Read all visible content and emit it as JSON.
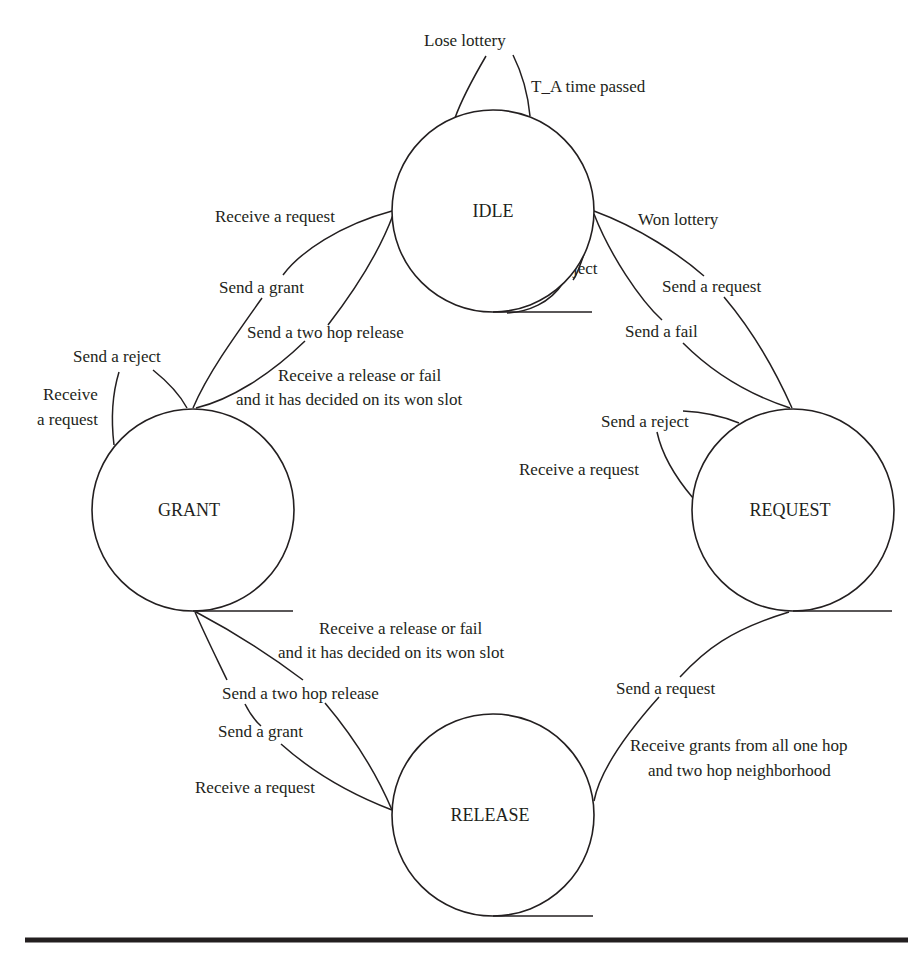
{
  "diagram": {
    "type": "state-machine",
    "states": {
      "idle": {
        "label": "IDLE",
        "cx": 493,
        "cy": 211,
        "r": 101
      },
      "request": {
        "label": "REQUEST",
        "cx": 793,
        "cy": 510,
        "r": 101
      },
      "grant": {
        "label": "GRANT",
        "cx": 193,
        "cy": 510,
        "r": 101
      },
      "release": {
        "label": "RELEASE",
        "cx": 493,
        "cy": 815,
        "r": 101
      }
    },
    "transitions": {
      "idle_self_lose": {
        "label": "Lose lottery"
      },
      "idle_self_timeout": {
        "label": "T_A time passed"
      },
      "idle_self_reject": {
        "label": "Receive a reject"
      },
      "idle_to_request_trigger": {
        "label": "Won lottery"
      },
      "idle_to_request_action": {
        "label": "Send a request"
      },
      "request_to_idle": {
        "label": "Send a fail"
      },
      "idle_to_grant_trigger": {
        "label": "Receive a request"
      },
      "idle_to_grant_action": {
        "label": "Send a grant"
      },
      "grant_to_idle_action": {
        "label": "Send a two hop release"
      },
      "grant_to_idle_trigger_line1": {
        "label": "Receive a release or fail"
      },
      "grant_to_idle_trigger_line2": {
        "label": "and it has decided on its won slot"
      },
      "grant_self_reject": {
        "label": "Send a reject"
      },
      "grant_self_request_line1": {
        "label": "Receive"
      },
      "grant_self_request_line2": {
        "label": "a request"
      },
      "request_self_reject": {
        "label": "Send a reject"
      },
      "request_self_request": {
        "label": "Receive a request"
      },
      "release_to_grant_trigger_line1": {
        "label": "Receive a release or fail"
      },
      "release_to_grant_trigger_line2": {
        "label": "and it has decided on its won slot"
      },
      "release_to_grant_action": {
        "label": "Send a two hop release"
      },
      "grant_to_release_action": {
        "label": "Send a grant"
      },
      "grant_to_release_trigger": {
        "label": "Receive a request"
      },
      "release_to_request_action": {
        "label": "Send a request"
      },
      "request_to_release_line1": {
        "label": "Receive grants from all one hop"
      },
      "request_to_release_line2": {
        "label": "and two hop neighborhood"
      }
    }
  }
}
